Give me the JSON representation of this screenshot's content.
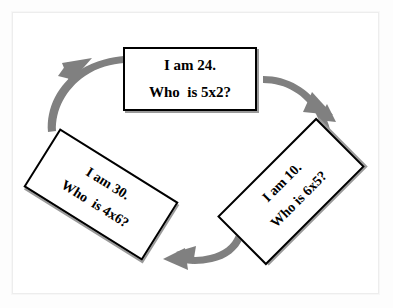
{
  "diagram": {
    "arrow_color": "#808080",
    "card_border_color": "#000000",
    "card_fill": "#ffffff",
    "cards": [
      {
        "id": "top",
        "answer_line": "I am 24.",
        "question_line": "Who  is 5x2?",
        "rotation": "0"
      },
      {
        "id": "bottom-right",
        "answer_line": "I am 10.",
        "question_line": "Who is 6x5?",
        "rotation": "-45"
      },
      {
        "id": "bottom-left",
        "answer_line": "I am 30.",
        "question_line": "Who  is 4x6?",
        "rotation": "32"
      }
    ],
    "arrows": [
      {
        "id": "top-to-right",
        "direction": "down-right"
      },
      {
        "id": "right-to-left",
        "direction": "left"
      },
      {
        "id": "left-to-top",
        "direction": "up-right"
      }
    ]
  }
}
